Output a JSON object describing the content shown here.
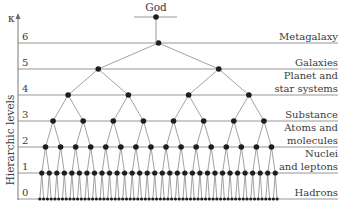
{
  "diagram": {
    "top_label": "God",
    "axis_symbol": "κ",
    "axis_title": "Hierarchic levels",
    "levels": [
      {
        "value": "0",
        "label": "Hadrons",
        "nodes": 64
      },
      {
        "value": "1",
        "label": "Nuclei and leptons",
        "label_lines": [
          "Nuclei",
          "and leptons"
        ],
        "nodes": 32
      },
      {
        "value": "2",
        "label": "Atoms and molecules",
        "label_lines": [
          "Atoms and",
          "molecules"
        ],
        "nodes": 16
      },
      {
        "value": "3",
        "label": "Substance",
        "label_lines": [
          "Substance"
        ],
        "nodes": 8
      },
      {
        "value": "4",
        "label": "Planet and star systems",
        "label_lines": [
          "Planet and",
          "star systems"
        ],
        "nodes": 4
      },
      {
        "value": "5",
        "label": "Galaxies",
        "label_lines": [
          "Galaxies"
        ],
        "nodes": 2
      },
      {
        "value": "6",
        "label": "Metagalaxy",
        "label_lines": [
          "Metagalaxy"
        ],
        "nodes": 1
      }
    ],
    "colors": {
      "line": "#8a8a8a",
      "node": "#1e1e1e",
      "text": "#3a3a3a"
    }
  }
}
